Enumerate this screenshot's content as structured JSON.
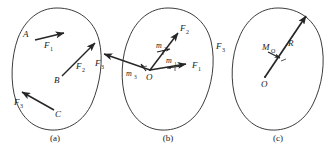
{
  "figure": {
    "stroke_color": "#262626",
    "label_color": "#1a1a1a",
    "background": "#ffffff",
    "panels": [
      {
        "caption": "(a)",
        "description": "Rigid body with three forces applied at points A, B and C",
        "point_labels": [
          "A",
          "B",
          "C"
        ],
        "force_labels": [
          "F",
          "F",
          "F"
        ],
        "force_subscripts": [
          "1",
          "2",
          "3"
        ],
        "vectors": [
          {
            "name": "F1",
            "base": "A",
            "label": "F",
            "sub": "1",
            "direction": "right-slightly-up"
          },
          {
            "name": "F2",
            "base": "B",
            "label": "F",
            "sub": "2",
            "direction": "up-right"
          },
          {
            "name": "F3",
            "base": "C",
            "label": "F",
            "sub": "3",
            "direction": "up-left"
          }
        ]
      },
      {
        "caption": "(b)",
        "description": "Forces translated to point O with accompanying couple moments",
        "origin_label": "O",
        "force_labels": [
          "F",
          "F",
          "F"
        ],
        "force_subscripts": [
          "1",
          "2",
          "3"
        ],
        "moment_labels": [
          "m",
          "m",
          "m"
        ],
        "moment_subscripts": [
          "1",
          "2",
          "3"
        ],
        "vectors": [
          {
            "name": "F1",
            "label": "F",
            "sub": "1",
            "direction": "right"
          },
          {
            "name": "F2",
            "label": "F",
            "sub": "2",
            "direction": "up-right"
          },
          {
            "name": "F3",
            "label": "F",
            "sub": "3",
            "direction": "left-up"
          }
        ],
        "moments": [
          {
            "name": "m1",
            "label": "m",
            "sub": "1",
            "sense": "counterclockwise"
          },
          {
            "name": "m2",
            "label": "m",
            "sub": "2",
            "sense": "counterclockwise"
          },
          {
            "name": "m3",
            "label": "m",
            "sub": "3",
            "sense": "counterclockwise"
          }
        ]
      },
      {
        "caption": "(c)",
        "description": "Resultant force R at O and resultant couple moment M_O",
        "origin_label": "O",
        "resultant_label": "R",
        "moment_label": "M",
        "moment_subscript": "O",
        "vectors": [
          {
            "name": "R",
            "label": "R",
            "direction": "up-right"
          }
        ],
        "moments": [
          {
            "name": "MO",
            "label": "M",
            "sub": "O",
            "sense": "counterclockwise"
          }
        ]
      }
    ]
  }
}
